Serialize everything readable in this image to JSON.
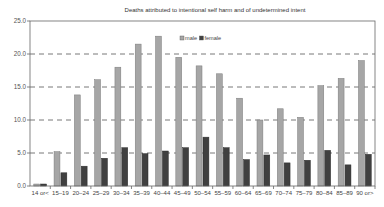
{
  "chart_data": {
    "type": "bar",
    "title": "Deaths attributed to intentional self harm and of undetermined intent",
    "xlabel": "",
    "ylabel": "",
    "ylim": [
      0,
      25
    ],
    "yticks": [
      "0.0",
      "5.0",
      "10.0",
      "15.0",
      "20.0",
      "25.0"
    ],
    "grid": "horizontal dashed",
    "legend_position": "top-center inside",
    "categories": [
      "14 or<",
      "15–19",
      "20–24",
      "25–29",
      "30–34",
      "35–39",
      "40–44",
      "45–49",
      "50–54",
      "55–59",
      "60–64",
      "65–69",
      "70–74",
      "75–79",
      "80–84",
      "85–89",
      "90 or>"
    ],
    "series": [
      {
        "name": "male",
        "color": "#a6a6a6",
        "values": [
          0.3,
          5.2,
          13.8,
          16.1,
          18.0,
          21.5,
          22.7,
          19.5,
          18.2,
          17.0,
          13.3,
          10.0,
          11.7,
          10.4,
          15.2,
          16.3,
          19.0
        ]
      },
      {
        "name": "female",
        "color": "#404040",
        "values": [
          0.3,
          2.0,
          3.0,
          4.2,
          5.8,
          4.9,
          5.3,
          5.8,
          7.4,
          5.8,
          4.0,
          4.7,
          3.5,
          3.9,
          5.4,
          3.2,
          4.8
        ]
      }
    ]
  }
}
